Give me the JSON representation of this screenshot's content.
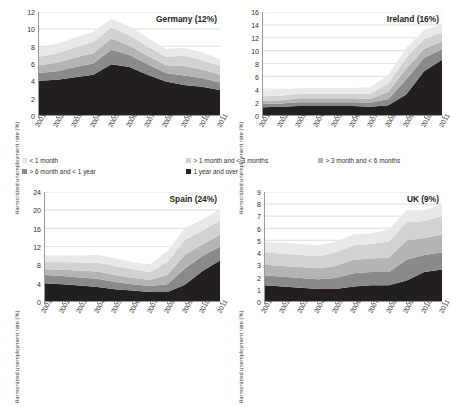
{
  "figure": {
    "axis_label": "Harmonized unemployment rate (%)",
    "colors": {
      "lt1": "#e8e8e8",
      "m1to3": "#d2d2d2",
      "m3to6": "#b4b4b4",
      "m6to1y": "#8a8a8a",
      "y1plus": "#231f20",
      "axis": "#9a9a9a",
      "grid": "#e3e3e3",
      "text": "#2e2e2e"
    }
  },
  "legend": {
    "items": [
      {
        "label": "< 1 month",
        "key": "lt1",
        "color": "#e8e8e8"
      },
      {
        "label": "> 1 month and < 3 months",
        "key": "m1to3",
        "color": "#d2d2d2"
      },
      {
        "label": "> 3 month and < 6 months",
        "key": "m3to6",
        "color": "#b4b4b4"
      },
      {
        "label": "> 6 month and < 1 year",
        "key": "m6to1y",
        "color": "#8a8a8a"
      },
      {
        "label": "1 year and over",
        "key": "y1plus",
        "color": "#231f20"
      }
    ]
  },
  "chart_data": [
    {
      "id": "germany",
      "type": "area",
      "title": "Germany (12%)",
      "xlabel": "",
      "ylabel": "Harmonized unemployment rate (%)",
      "x": [
        2001,
        2002,
        2003,
        2004,
        2005,
        2006,
        2007,
        2008,
        2009,
        2010,
        2011
      ],
      "xticklabels": [
        "2001",
        "2002",
        "2003",
        "2004",
        "2005",
        "2006",
        "2007",
        "2008",
        "2009",
        "2010",
        "2011"
      ],
      "ylim": [
        0,
        12
      ],
      "yticks": [
        0,
        2,
        4,
        6,
        8,
        10,
        12
      ],
      "grid": true,
      "stacked": true,
      "legend_position": "figure-center",
      "series": [
        {
          "name": "1 year and over",
          "color": "#231f20",
          "values": [
            4.0,
            4.1,
            4.4,
            4.7,
            5.9,
            5.6,
            4.7,
            3.9,
            3.5,
            3.3,
            2.9
          ]
        },
        {
          "name": "> 6 month and < 1 year",
          "color": "#8a8a8a",
          "values": [
            0.9,
            1.0,
            1.2,
            1.3,
            1.7,
            1.4,
            1.2,
            1.0,
            1.1,
            1.0,
            0.9
          ]
        },
        {
          "name": "> 3 month and < 6 months",
          "color": "#b4b4b4",
          "values": [
            0.9,
            1.0,
            1.1,
            1.2,
            1.3,
            1.1,
            1.0,
            0.9,
            1.1,
            1.0,
            0.9
          ]
        },
        {
          "name": "> 1 month and < 3 months",
          "color": "#d2d2d2",
          "values": [
            1.0,
            1.1,
            1.2,
            1.3,
            1.3,
            1.2,
            1.1,
            1.0,
            1.2,
            1.1,
            1.0
          ]
        },
        {
          "name": "< 1 month",
          "color": "#e8e8e8",
          "values": [
            1.1,
            1.1,
            1.1,
            1.2,
            1.0,
            1.0,
            1.0,
            0.9,
            0.9,
            0.9,
            0.8
          ]
        }
      ],
      "totals": [
        7.9,
        8.3,
        9.0,
        9.7,
        11.2,
        10.3,
        9.0,
        7.7,
        7.8,
        7.3,
        6.5
      ]
    },
    {
      "id": "ireland",
      "type": "area",
      "title": "Ireland (16%)",
      "xlabel": "",
      "ylabel": "Harmonized unemployment rate (%)",
      "x": [
        2001,
        2002,
        2003,
        2004,
        2005,
        2006,
        2007,
        2008,
        2009,
        2010,
        2011
      ],
      "xticklabels": [
        "2001",
        "2002",
        "2003",
        "2004",
        "2005",
        "2006",
        "2007",
        "2008",
        "2009",
        "2010",
        "2011"
      ],
      "ylim": [
        0,
        16
      ],
      "yticks": [
        0,
        2,
        4,
        6,
        8,
        10,
        12,
        14,
        16
      ],
      "grid": true,
      "stacked": true,
      "legend_position": "figure-center",
      "series": [
        {
          "name": "1 year and over",
          "color": "#231f20",
          "values": [
            1.2,
            1.3,
            1.4,
            1.4,
            1.4,
            1.4,
            1.3,
            1.5,
            3.2,
            6.8,
            8.6
          ]
        },
        {
          "name": "> 6 month and < 1 year",
          "color": "#8a8a8a",
          "values": [
            0.5,
            0.5,
            0.6,
            0.6,
            0.6,
            0.6,
            0.6,
            1.0,
            2.3,
            2.1,
            1.6
          ]
        },
        {
          "name": "> 3 month and < 6 months",
          "color": "#b4b4b4",
          "values": [
            0.5,
            0.5,
            0.6,
            0.6,
            0.6,
            0.6,
            0.6,
            1.1,
            1.7,
            1.4,
            1.2
          ]
        },
        {
          "name": "> 1 month and < 3 months",
          "color": "#d2d2d2",
          "values": [
            0.7,
            0.7,
            0.7,
            0.7,
            0.7,
            0.7,
            0.8,
            1.3,
            1.7,
            1.5,
            1.4
          ]
        },
        {
          "name": "< 1 month",
          "color": "#e8e8e8",
          "values": [
            0.9,
            0.9,
            0.9,
            0.9,
            0.9,
            0.9,
            1.0,
            1.3,
            1.5,
            1.4,
            1.3
          ]
        }
      ],
      "totals": [
        3.8,
        3.9,
        4.2,
        4.2,
        4.2,
        4.2,
        4.3,
        6.2,
        10.4,
        13.2,
        14.1
      ]
    },
    {
      "id": "spain",
      "type": "area",
      "title": "Spain (24%)",
      "xlabel": "",
      "ylabel": "Harmonized unemployment rate (%)",
      "x": [
        2001,
        2002,
        2003,
        2004,
        2005,
        2006,
        2007,
        2008,
        2009,
        2010,
        2011
      ],
      "xticklabels": [
        "2001",
        "2002",
        "2003",
        "2004",
        "2005",
        "2006",
        "2007",
        "2008",
        "2009",
        "2010",
        "2011"
      ],
      "ylim": [
        0,
        24
      ],
      "yticks": [
        0,
        4,
        8,
        12,
        16,
        20,
        24
      ],
      "grid": true,
      "stacked": true,
      "legend_position": "figure-center",
      "series": [
        {
          "name": "1 year and over",
          "color": "#231f20",
          "values": [
            3.9,
            3.7,
            3.4,
            3.1,
            2.6,
            2.3,
            2.0,
            2.0,
            3.6,
            6.6,
            8.9
          ]
        },
        {
          "name": "> 6 month and < 1 year",
          "color": "#8a8a8a",
          "values": [
            1.8,
            1.8,
            1.8,
            1.8,
            1.6,
            1.4,
            1.3,
            1.7,
            3.6,
            3.3,
            3.1
          ]
        },
        {
          "name": "> 3 month and < 6 months",
          "color": "#b4b4b4",
          "values": [
            1.3,
            1.4,
            1.5,
            1.6,
            1.5,
            1.4,
            1.3,
            2.1,
            3.0,
            2.6,
            2.6
          ]
        },
        {
          "name": "> 1 month and < 3 months",
          "color": "#d2d2d2",
          "values": [
            1.6,
            1.7,
            1.8,
            2.0,
            2.0,
            1.9,
            1.8,
            2.8,
            3.3,
            3.0,
            3.1
          ]
        },
        {
          "name": "< 1 month",
          "color": "#e8e8e8",
          "values": [
            1.4,
            1.4,
            1.5,
            1.7,
            1.7,
            1.6,
            1.6,
            2.4,
            2.6,
            2.5,
            2.5
          ]
        }
      ],
      "totals": [
        10.0,
        10.0,
        10.0,
        10.2,
        9.4,
        8.6,
        8.0,
        11.0,
        16.1,
        18.0,
        20.2
      ]
    },
    {
      "id": "uk",
      "type": "area",
      "title": "UK (9%)",
      "xlabel": "",
      "ylabel": "Harmonized unemployment rate (%)",
      "x": [
        2001,
        2002,
        2003,
        2004,
        2005,
        2006,
        2007,
        2008,
        2009,
        2010,
        2011
      ],
      "xticklabels": [
        "2001",
        "2002",
        "2003",
        "2004",
        "2005",
        "2006",
        "2007",
        "2008",
        "2009",
        "2010",
        "2011"
      ],
      "ylim": [
        0,
        9
      ],
      "yticks": [
        0,
        1,
        2,
        3,
        4,
        5,
        6,
        7,
        8,
        9
      ],
      "grid": true,
      "stacked": true,
      "legend_position": "figure-center",
      "series": [
        {
          "name": "1 year and over",
          "color": "#231f20",
          "values": [
            1.3,
            1.2,
            1.1,
            1.0,
            1.0,
            1.2,
            1.3,
            1.3,
            1.7,
            2.4,
            2.6
          ]
        },
        {
          "name": "> 6 month and < 1 year",
          "color": "#8a8a8a",
          "values": [
            0.8,
            0.8,
            0.8,
            0.8,
            0.9,
            1.1,
            1.1,
            1.1,
            1.7,
            1.4,
            1.4
          ]
        },
        {
          "name": "> 3 month and < 6 months",
          "color": "#b4b4b4",
          "values": [
            0.9,
            0.9,
            0.9,
            0.9,
            1.0,
            1.1,
            1.1,
            1.2,
            1.6,
            1.4,
            1.5
          ]
        },
        {
          "name": "> 1 month and < 3 months",
          "color": "#d2d2d2",
          "values": [
            1.0,
            1.0,
            1.0,
            1.0,
            1.1,
            1.2,
            1.2,
            1.3,
            1.5,
            1.4,
            1.5
          ]
        },
        {
          "name": "< 1 month",
          "color": "#e8e8e8",
          "values": [
            0.9,
            0.9,
            0.9,
            0.9,
            0.9,
            0.9,
            0.9,
            1.0,
            1.0,
            0.9,
            1.0
          ]
        }
      ],
      "totals": [
        4.9,
        4.8,
        4.7,
        4.6,
        4.9,
        5.5,
        5.6,
        5.9,
        7.5,
        7.5,
        8.0
      ]
    }
  ]
}
